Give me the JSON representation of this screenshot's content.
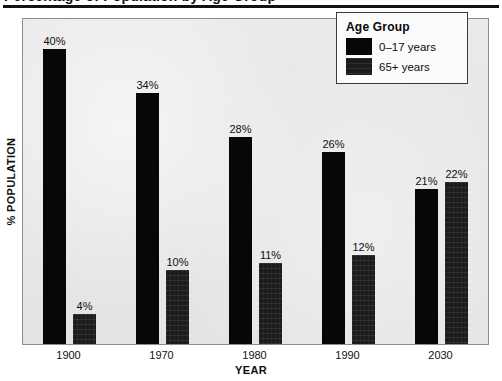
{
  "title_strip": {
    "clipped_title": "Percentage of Population by Age Group"
  },
  "chart_data": {
    "type": "bar",
    "title": "",
    "xlabel": "YEAR",
    "ylabel": "% POPULATION",
    "categories": [
      "1900",
      "1970",
      "1980",
      "1990",
      "2030"
    ],
    "ylim": [
      0,
      44
    ],
    "grid": false,
    "legend_position": "top-right",
    "series": [
      {
        "name": "0–17 years",
        "color": "#070707",
        "values": [
          40,
          34,
          28,
          26,
          21
        ],
        "labels": [
          "40%",
          "34%",
          "28%",
          "26%",
          "21%"
        ]
      },
      {
        "name": "65+ years",
        "color": "#1b1b1b",
        "values": [
          4,
          10,
          11,
          12,
          22
        ],
        "labels": [
          "4%",
          "10%",
          "11%",
          "12%",
          "22%"
        ]
      }
    ]
  },
  "legend": {
    "title": "Age Group",
    "items": [
      {
        "label": "0–17 years",
        "swatch": "series-young"
      },
      {
        "label": "65+ years",
        "swatch": "series-old"
      }
    ]
  }
}
